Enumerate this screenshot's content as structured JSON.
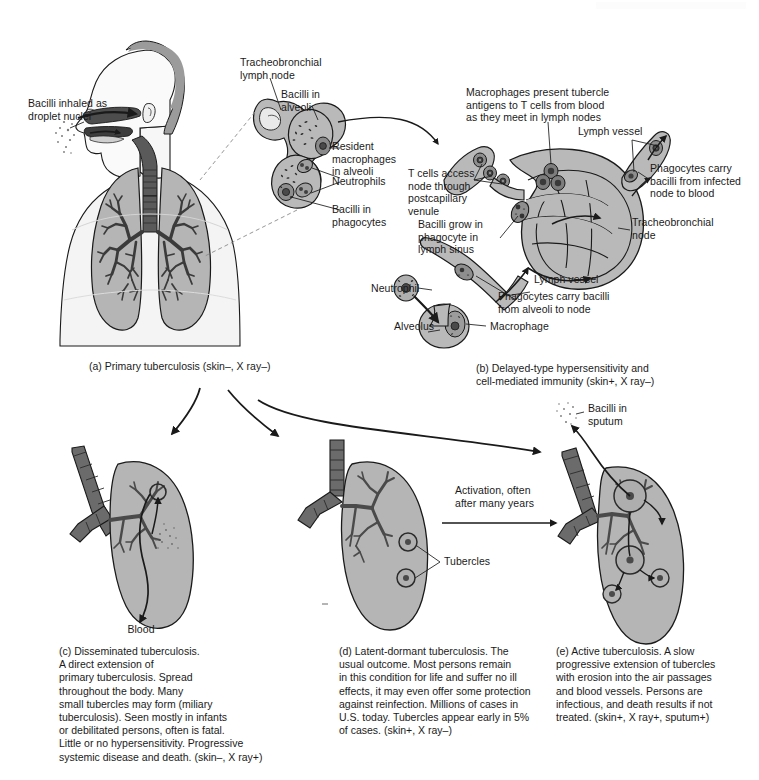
{
  "figure": {
    "background_color": "#ffffff",
    "tissue_color": "#b3b3b3",
    "airway_color": "#666666",
    "skin_color": "#f2f2f2",
    "hair_color": "#999999",
    "line_color": "#1a1a1a"
  },
  "panel_a": {
    "caption": "(a) Primary tuberculosis (skin–, X ray–)",
    "labels": {
      "inhaled": "Bacilli inhaled as\ndroplet nuclei",
      "lymph_node": "Tracheobronchial\nlymph node",
      "bacilli_alveoli": "Bacilli in\nalveoli",
      "resident_macrophages": "Resident\nmacrophages\nin alveoli",
      "neutrophils": "Neutrophils",
      "bacilli_phagocytes": "Bacilli in\nphagocytes"
    }
  },
  "panel_b": {
    "caption": "(b) Delayed-type hypersensitivity and\n     cell-mediated immunity (skin+, X ray–)",
    "labels": {
      "macrophages_present": "Macrophages present tubercle\nantigens to T cells from blood\nas they meet in lymph nodes",
      "lymph_vessel_top": "Lymph vessel",
      "phagocytes_infected": "Phagocytes carry\nbacilli from infected\nnode to blood",
      "t_cells_access": "T cells access\nnode through\npostcapillary\nvenule",
      "bacilli_grow": "Bacilli grow in\nphagocyte in\nlymph sinus",
      "tracheobronchial_node": "Tracheobronchial\nnode",
      "lymph_vessel_mid": "Lymph vessel",
      "phagocytes_alveoli": "Phagocytes carry bacilli\nfrom alveoli to node",
      "neutrophil": "Neutrophil",
      "alveolus": "Alveolus",
      "macrophage": "Macrophage"
    }
  },
  "panel_c": {
    "caption": "(c) Disseminated tuberculosis.\nA direct extension of\nprimary tuberculosis. Spread\nthroughout the body. Many\nsmall tubercles may form (miliary\ntuberculosis). Seen mostly in infants\nor debilitated persons, often is fatal.\nLittle or no hypersensitivity. Progressive\nsystemic disease and death. (skin–, X ray+)",
    "labels": {
      "blood": "Blood"
    }
  },
  "panel_d": {
    "caption": "(d) Latent-dormant tuberculosis. The\nusual outcome. Most persons remain\nin this condition for life and suffer no ill\neffects, it may even offer some protection\nagainst reinfection. Millions of cases in\nU.S. today. Tubercles appear early in 5%\nof cases. (skin+, X ray–)",
    "labels": {
      "tubercles": "Tubercles"
    }
  },
  "panel_e": {
    "caption": "(e) Active tuberculosis. A slow\nprogressive extension of tubercles\nwith erosion into the air passages\nand blood vessels. Persons are\ninfectious, and death results if not\ntreated. (skin+, X ray+, sputum+)",
    "labels": {
      "bacilli_sputum": "Bacilli in\nsputum"
    }
  },
  "transitions": {
    "activation": "Activation, often\nafter many years"
  }
}
